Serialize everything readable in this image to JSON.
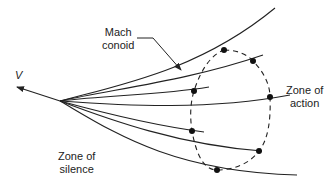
{
  "diagram": {
    "type": "wave-propagation",
    "title": "",
    "labels": {
      "velocity": "V",
      "mach_conoid": [
        "Mach",
        "conoid"
      ],
      "zone_of_action": [
        "Zone of",
        "action"
      ],
      "zone_of_silence": [
        "Zone of",
        "silence"
      ]
    },
    "vertex": [
      60,
      101
    ],
    "velocity_arrow": {
      "from": [
        60,
        101
      ],
      "to": [
        16,
        87
      ]
    },
    "rays": [
      {
        "name": "mach-conoid",
        "end": [
          275,
          8
        ]
      },
      {
        "name": "ray-2",
        "end": [
          263,
          55
        ]
      },
      {
        "name": "ray-3",
        "end": [
          209,
          87
        ]
      },
      {
        "name": "ray-4",
        "end": [
          290,
          95
        ]
      },
      {
        "name": "ray-5",
        "end": [
          204,
          132
        ]
      },
      {
        "name": "ray-6",
        "end": [
          262,
          151
        ]
      },
      {
        "name": "ray-7",
        "end": [
          297,
          175
        ]
      }
    ],
    "points": [
      [
        224,
        50
      ],
      [
        253,
        61
      ],
      [
        194,
        91
      ],
      [
        270,
        97
      ],
      [
        192,
        131
      ],
      [
        259,
        151
      ],
      [
        217,
        170
      ]
    ],
    "loop": "dashed closed curve through wavefront points",
    "colors": {
      "line": "#222222",
      "background": "#ffffff"
    }
  }
}
